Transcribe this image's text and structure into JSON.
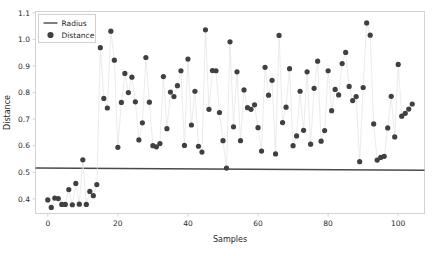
{
  "chart_data": {
    "type": "scatter",
    "title": "",
    "xlabel": "Samples",
    "ylabel": "Distance",
    "xlim": [
      -3.5,
      107.5
    ],
    "ylim": [
      0.345,
      1.105
    ],
    "xticks": [
      0,
      20,
      40,
      60,
      80,
      100
    ],
    "xticklabels": [
      "0",
      "20",
      "40",
      "60",
      "80",
      "100"
    ],
    "yticks": [
      0.4,
      0.5,
      0.6,
      0.7,
      0.8,
      0.9,
      1.0,
      1.1
    ],
    "yticklabels": [
      "0.4",
      "0.5",
      "0.6",
      "0.7",
      "0.8",
      "0.9",
      "1.0",
      "1.1"
    ],
    "grid": false,
    "legend_position": "upper left",
    "legend": [
      {
        "label": "Radius",
        "kind": "line",
        "color": "#4a4a4a"
      },
      {
        "label": "Distance",
        "kind": "marker",
        "color": "#404040"
      }
    ],
    "series": [
      {
        "name": "Radius",
        "kind": "line",
        "color": "#4a4a4a",
        "linewidth": 1.6,
        "x": [
          -3.5,
          107.5
        ],
        "values": [
          0.516,
          0.508
        ]
      },
      {
        "name": "Distance",
        "kind": "scatter_with_line",
        "marker_color": "#404040",
        "line_color": "#e2e2e2",
        "marker_size": 2.6,
        "x": [
          0,
          1,
          2,
          3,
          4,
          5,
          6,
          7,
          8,
          9,
          10,
          11,
          12,
          13,
          14,
          15,
          16,
          17,
          18,
          19,
          20,
          21,
          22,
          23,
          24,
          25,
          26,
          27,
          28,
          29,
          30,
          31,
          32,
          33,
          34,
          35,
          36,
          37,
          38,
          39,
          40,
          41,
          42,
          43,
          44,
          45,
          46,
          47,
          48,
          49,
          50,
          51,
          52,
          53,
          54,
          55,
          56,
          57,
          58,
          59,
          60,
          61,
          62,
          63,
          64,
          65,
          66,
          67,
          68,
          69,
          70,
          71,
          72,
          73,
          74,
          75,
          76,
          77,
          78,
          79,
          80,
          81,
          82,
          83,
          84,
          85,
          86,
          87,
          88,
          89,
          90,
          91,
          92,
          93,
          94,
          95,
          96,
          97,
          98,
          99,
          100,
          101,
          102,
          103,
          104
        ],
        "values": [
          0.396,
          0.368,
          0.403,
          0.401,
          0.379,
          0.379,
          0.435,
          0.378,
          0.458,
          0.38,
          0.547,
          0.379,
          0.428,
          0.412,
          0.454,
          0.969,
          0.778,
          0.742,
          1.031,
          0.922,
          0.594,
          0.763,
          0.872,
          0.8,
          0.858,
          0.765,
          0.622,
          0.686,
          0.932,
          0.764,
          0.6,
          0.596,
          0.608,
          0.86,
          0.664,
          0.802,
          0.785,
          0.826,
          0.882,
          0.601,
          0.926,
          0.678,
          0.805,
          0.598,
          0.576,
          1.036,
          0.737,
          0.883,
          0.882,
          0.725,
          0.619,
          0.516,
          0.991,
          0.671,
          0.878,
          0.619,
          0.81,
          0.743,
          0.737,
          0.754,
          0.668,
          0.58,
          0.895,
          0.79,
          0.846,
          0.569,
          1.015,
          0.687,
          0.745,
          0.89,
          0.6,
          0.637,
          0.805,
          0.658,
          0.878,
          0.606,
          0.816,
          0.918,
          0.617,
          0.657,
          0.882,
          0.732,
          0.812,
          0.791,
          0.909,
          0.951,
          0.823,
          0.77,
          0.785,
          0.54,
          0.819,
          1.062,
          1.016,
          0.682,
          0.546,
          0.556,
          0.56,
          0.667,
          0.786,
          0.633,
          0.906,
          0.711,
          0.722,
          0.738,
          0.757
        ]
      }
    ]
  }
}
